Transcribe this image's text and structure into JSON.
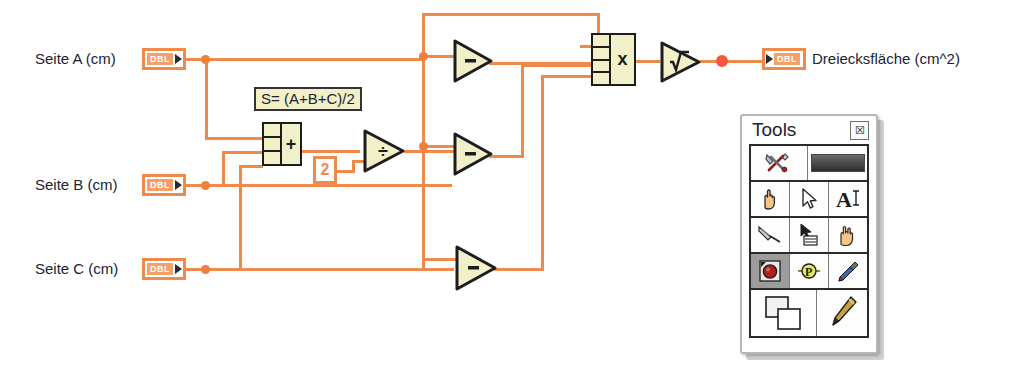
{
  "diagram": {
    "kind": "labview-block-diagram",
    "background_color": "#ffffff",
    "wire_color": "#f08a4b",
    "node_fill": "#f2f0c8",
    "node_border": "#1d1d1d",
    "controls": [
      {
        "label": "Seite A (cm)",
        "datatype": "DBL"
      },
      {
        "label": "Seite B (cm)",
        "datatype": "DBL"
      },
      {
        "label": "Seite C (cm)",
        "datatype": "DBL"
      }
    ],
    "indicator": {
      "label": "Dreiecksfläche (cm^2)",
      "datatype": "DBL"
    },
    "formula_label": "S= (A+B+C)/2",
    "constant": "2",
    "nodes": {
      "add": {
        "op": "+",
        "inputs": 3,
        "name": "compound-add"
      },
      "divide": {
        "op": "÷",
        "name": "divide"
      },
      "subtract_a": {
        "op": "−",
        "name": "subtract"
      },
      "subtract_b": {
        "op": "−",
        "name": "subtract"
      },
      "subtract_c": {
        "op": "−",
        "name": "subtract"
      },
      "multiply": {
        "op": "x",
        "inputs": 4,
        "name": "compound-multiply"
      },
      "sqrt": {
        "op": "√",
        "name": "square-root"
      }
    }
  },
  "tools_palette": {
    "title": "Tools",
    "close_glyph": "☒",
    "rows": [
      {
        "cells": [
          {
            "name": "automatic-tool-selection-icon",
            "label": "Automatic Tool Selection"
          },
          {
            "name": "automatic-tool-indicator",
            "label": "Auto"
          }
        ]
      },
      {
        "cells": [
          {
            "name": "operate-value-tool-icon",
            "label": "Operate Value"
          },
          {
            "name": "position-size-select-tool-icon",
            "label": "Position/Size/Select"
          },
          {
            "name": "edit-text-tool-icon",
            "label": "Edit Text"
          }
        ]
      },
      {
        "cells": [
          {
            "name": "connect-wire-tool-icon",
            "label": "Connect Wire"
          },
          {
            "name": "object-shortcut-menu-tool-icon",
            "label": "Object Shortcut Menu"
          },
          {
            "name": "scroll-window-tool-icon",
            "label": "Scroll Window"
          }
        ]
      },
      {
        "cells": [
          {
            "name": "set-clear-breakpoint-tool-icon",
            "label": "Set/Clear Breakpoint"
          },
          {
            "name": "probe-data-tool-icon",
            "label": "Probe Data"
          },
          {
            "name": "get-color-tool-icon",
            "label": "Get Color"
          }
        ]
      },
      {
        "cells": [
          {
            "name": "set-color-tool-icon",
            "label": "Set Color"
          },
          {
            "name": "paint-tool-icon",
            "label": "Paint"
          }
        ]
      }
    ]
  }
}
